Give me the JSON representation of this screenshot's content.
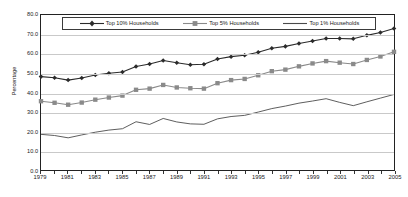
{
  "chart_data": {
    "type": "line",
    "title": "",
    "xlabel": "",
    "ylabel": "Percentage",
    "xlim": [
      1979,
      2005
    ],
    "ylim": [
      0,
      80
    ],
    "ytick_step": 10,
    "grid": true,
    "legend_position": "top-inside",
    "x": [
      1979,
      1980,
      1981,
      1982,
      1983,
      1984,
      1985,
      1986,
      1987,
      1988,
      1989,
      1990,
      1991,
      1992,
      1993,
      1994,
      1995,
      1996,
      1997,
      1998,
      1999,
      2000,
      2001,
      2002,
      2003,
      2004,
      2005
    ],
    "xtick_labels": [
      "1979",
      "1981",
      "1983",
      "1985",
      "1987",
      "1989",
      "1991",
      "1993",
      "1995",
      "1997",
      "1999",
      "2001",
      "2003",
      "2005"
    ],
    "ytick_labels": [
      "0.0",
      "10.0",
      "20.0",
      "30.0",
      "40.0",
      "50.0",
      "60.0",
      "70.0",
      "80.0"
    ],
    "series": [
      {
        "name": "Top 10% Households",
        "marker": "diamond",
        "color": "#2b2b2b",
        "values": [
          48.2,
          47.6,
          46.4,
          47.5,
          49.0,
          49.9,
          50.6,
          53.4,
          54.7,
          56.5,
          55.4,
          54.3,
          54.6,
          57.3,
          58.5,
          59.2,
          60.8,
          62.8,
          63.8,
          65.3,
          66.6,
          67.9,
          67.9,
          67.7,
          69.5,
          71.0,
          73.0
        ]
      },
      {
        "name": "Top 5% Households",
        "marker": "square",
        "color": "#8a8a8a",
        "values": [
          35.5,
          34.7,
          33.7,
          34.8,
          36.3,
          37.4,
          38.4,
          41.4,
          42.0,
          43.9,
          42.6,
          42.2,
          42.0,
          44.8,
          46.4,
          47.0,
          48.9,
          51.0,
          51.8,
          53.5,
          55.0,
          56.2,
          55.4,
          54.7,
          56.8,
          58.6,
          61.0
        ]
      },
      {
        "name": "Top 1% Households",
        "marker": "none",
        "color": "#4a4a4a",
        "values": [
          18.4,
          17.8,
          16.6,
          18.1,
          19.5,
          20.6,
          21.3,
          24.9,
          23.5,
          26.6,
          24.8,
          23.8,
          23.6,
          26.4,
          27.6,
          28.2,
          29.9,
          31.7,
          33.0,
          34.5,
          35.6,
          36.8,
          34.9,
          33.2,
          35.2,
          37.1,
          39.0
        ]
      }
    ]
  }
}
